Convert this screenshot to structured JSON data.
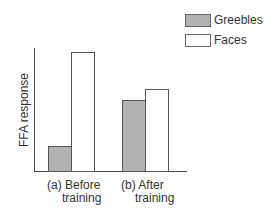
{
  "chart_data": {
    "type": "bar",
    "title": "",
    "xlabel": "",
    "ylabel": "FFA response",
    "categories": [
      "(a) Before training",
      "(b) After training"
    ],
    "category_lines": [
      [
        "(a) Before",
        "training"
      ],
      [
        "(b) After",
        "training"
      ]
    ],
    "series": [
      {
        "name": "Greebles",
        "values": [
          20,
          58
        ],
        "color": "#b3b3b3"
      },
      {
        "name": "Faces",
        "values": [
          97,
          67
        ],
        "color": "#ffffff"
      }
    ],
    "ylim": [
      0,
      100
    ],
    "grid": false,
    "legend_position": "top-right",
    "y_ticks": []
  },
  "legend": {
    "items": [
      {
        "label": "Greebles",
        "color": "#b3b3b3"
      },
      {
        "label": "Faces",
        "color": "#ffffff"
      }
    ]
  }
}
